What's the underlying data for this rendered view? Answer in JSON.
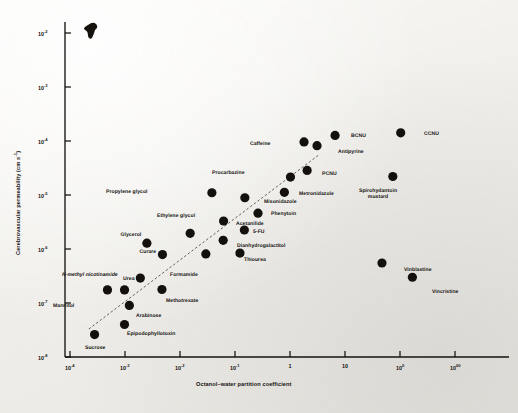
{
  "figure": {
    "x_axis_title": "Octanol–water partition coefficient",
    "y_axis_title_main": "Cerebrovascular permeability (cm s",
    "y_axis_title_exp": "-1",
    "y_axis_title_close": ")"
  },
  "chart_data": {
    "type": "scatter",
    "title": "",
    "xlabel": "Octanol–water partition coefficient",
    "ylabel": "Cerebrovascular permeability (cm s⁻¹)",
    "xscale": "log",
    "yscale": "log",
    "xlim": [
      0.0001,
      4000
    ],
    "ylim": [
      1e-08,
      0.01
    ],
    "grid": false,
    "legend": "none",
    "xticks": [
      "10-4",
      "10-3",
      "10-2",
      "10-1",
      "1",
      "10",
      "100",
      "1000"
    ],
    "xtick_values": [
      0.0001,
      0.001,
      0.01,
      0.1,
      1,
      10,
      100,
      1000
    ],
    "yticks": [
      "10-2",
      "10-3",
      "10-4",
      "10-5",
      "10-6",
      "10-7",
      "10-8"
    ],
    "ytick_values": [
      0.01,
      0.001,
      0.0001,
      1e-05,
      1e-06,
      1e-07,
      1e-08
    ],
    "trendline": {
      "style": "dashed",
      "x_start": 0.00022,
      "y_start": 3.3e-08,
      "x_end": 3.4,
      "y_end": 5.6e-05
    },
    "points": [
      {
        "label": "Sucrose",
        "x": 0.00028,
        "y": 2.6e-08,
        "lx": 95,
        "ly": 345,
        "anchor": "below"
      },
      {
        "label": "Epipodophyllotoxin",
        "x": 0.00098,
        "y": 4e-08,
        "lx": 127,
        "ly": 331,
        "anchor": "right"
      },
      {
        "label": "Arabinose",
        "x": 0.0012,
        "y": 9e-08,
        "lx": 136,
        "ly": 313,
        "anchor": "right"
      },
      {
        "label": "Mannitol",
        "x": 0.00048,
        "y": 1.75e-07,
        "lx": 74,
        "ly": 303,
        "anchor": "left"
      },
      {
        "label": "N-methyl nicotinamide",
        "x": 0.00098,
        "y": 1.75e-07,
        "lx": 90,
        "ly": 272,
        "anchor": "above",
        "italic": true
      },
      {
        "label": "Methotrexate",
        "x": 0.0047,
        "y": 1.78e-07,
        "lx": 166,
        "ly": 298,
        "anchor": "right"
      },
      {
        "label": "Urea",
        "x": 0.0019,
        "y": 2.9e-07,
        "lx": 129,
        "ly": 276,
        "anchor": "above"
      },
      {
        "label": "Curare",
        "x": 0.0048,
        "y": 7.9e-07,
        "lx": 148,
        "ly": 249,
        "anchor": "above"
      },
      {
        "label": "Glycerol",
        "x": 0.0025,
        "y": 1.28e-06,
        "lx": 131,
        "ly": 232,
        "anchor": "above"
      },
      {
        "label": "Formamide",
        "x": 0.0295,
        "y": 8.1e-07,
        "lx": 184,
        "ly": 272,
        "anchor": "below"
      },
      {
        "label": "Ethylene glycol",
        "x": 0.0153,
        "y": 1.95e-06,
        "lx": 176,
        "ly": 213,
        "anchor": "above"
      },
      {
        "label": "Propylene glycol",
        "x": 0.038,
        "y": 1.1e-05,
        "lx": 148,
        "ly": 189,
        "anchor": "left"
      },
      {
        "label": "Thiourea",
        "x": 0.123,
        "y": 8.4e-07,
        "lx": 244,
        "ly": 257,
        "anchor": "right"
      },
      {
        "label": "Dianhydrogalactitol",
        "x": 0.061,
        "y": 1.45e-06,
        "lx": 237,
        "ly": 243,
        "anchor": "right"
      },
      {
        "label": "5-FU",
        "x": 0.148,
        "y": 2.25e-06,
        "lx": 253,
        "ly": 229,
        "anchor": "right"
      },
      {
        "label": "Acetanilide",
        "x": 0.062,
        "y": 3.3e-06,
        "lx": 236,
        "ly": 221,
        "anchor": "right"
      },
      {
        "label": "Phenytoin",
        "x": 0.262,
        "y": 4.6e-06,
        "lx": 271,
        "ly": 211,
        "anchor": "right"
      },
      {
        "label": "Misonidazole",
        "x": 0.151,
        "y": 8.9e-06,
        "lx": 264,
        "ly": 199,
        "anchor": "right"
      },
      {
        "label": "Metronidazole",
        "x": 0.79,
        "y": 1.12e-05,
        "lx": 299,
        "ly": 191,
        "anchor": "right"
      },
      {
        "label": "Procarbazine",
        "x": 1.02,
        "y": 2.15e-05,
        "lx": 245,
        "ly": 170,
        "anchor": "left"
      },
      {
        "label": "PCNU",
        "x": 2.05,
        "y": 2.85e-05,
        "lx": 322,
        "ly": 171,
        "anchor": "right"
      },
      {
        "label": "Caffeine",
        "x": 1.8,
        "y": 9.6e-05,
        "lx": 271,
        "ly": 141,
        "anchor": "left"
      },
      {
        "label": "Antipyrine",
        "x": 3.1,
        "y": 8.2e-05,
        "lx": 338,
        "ly": 149,
        "anchor": "right"
      },
      {
        "label": "BCNU",
        "x": 6.6,
        "y": 0.000127,
        "lx": 351,
        "ly": 133,
        "anchor": "right"
      },
      {
        "label": "CCNU",
        "x": 103,
        "y": 0.000142,
        "lx": 424,
        "ly": 131,
        "anchor": "right"
      },
      {
        "label": "Spirohydantoin mustard",
        "x": 74,
        "y": 2.2e-05,
        "lx": 378,
        "ly": 188,
        "anchor": "below2",
        "line2": "mustard"
      },
      {
        "label": "Vinblastine",
        "x": 47,
        "y": 5.5e-07,
        "lx": 404,
        "ly": 267,
        "anchor": "right"
      },
      {
        "label": "Vincristine",
        "x": 168,
        "y": 3e-07,
        "lx": 432,
        "ly": 289,
        "anchor": "right"
      }
    ]
  }
}
